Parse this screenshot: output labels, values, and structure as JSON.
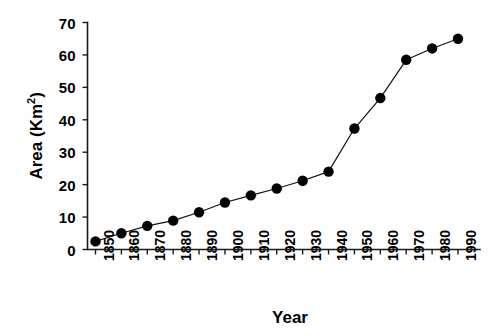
{
  "chart_data": {
    "type": "line",
    "title": "",
    "xlabel": "Year",
    "ylabel": "Area (Km2)",
    "ylabel_base": "Area (Km",
    "ylabel_sup": "2",
    "ylabel_close": ")",
    "x": [
      1850,
      1860,
      1870,
      1880,
      1890,
      1900,
      1910,
      1920,
      1930,
      1940,
      1950,
      1960,
      1970,
      1980,
      1990
    ],
    "values": [
      2.5,
      5.0,
      7.3,
      8.9,
      11.5,
      14.5,
      16.7,
      18.8,
      21.2,
      24.0,
      37.3,
      46.7,
      58.5,
      62.0,
      65.0
    ],
    "series": [
      {
        "name": "Area",
        "values": [
          2.5,
          5.0,
          7.3,
          8.9,
          11.5,
          14.5,
          16.7,
          18.8,
          21.2,
          24.0,
          37.3,
          46.7,
          58.5,
          62.0,
          65.0
        ]
      }
    ],
    "xtick_labels": [
      "1850",
      "1860",
      "1870",
      "1880",
      "1890",
      "1900",
      "1910",
      "1920",
      "1930",
      "1940",
      "1950",
      "1960",
      "1970",
      "1980",
      "1990"
    ],
    "ytick_labels": [
      "0",
      "10",
      "20",
      "30",
      "40",
      "50",
      "60",
      "70"
    ],
    "ytick_values": [
      0,
      10,
      20,
      30,
      40,
      50,
      60,
      70
    ],
    "xlim": [
      1845,
      1995
    ],
    "ylim": [
      0,
      70
    ],
    "grid": false,
    "legend": "none",
    "marker": "filled-circle",
    "line_color": "#000000",
    "marker_color": "#000000",
    "background_color": "#ffffff",
    "xtick_rotation": -90
  }
}
